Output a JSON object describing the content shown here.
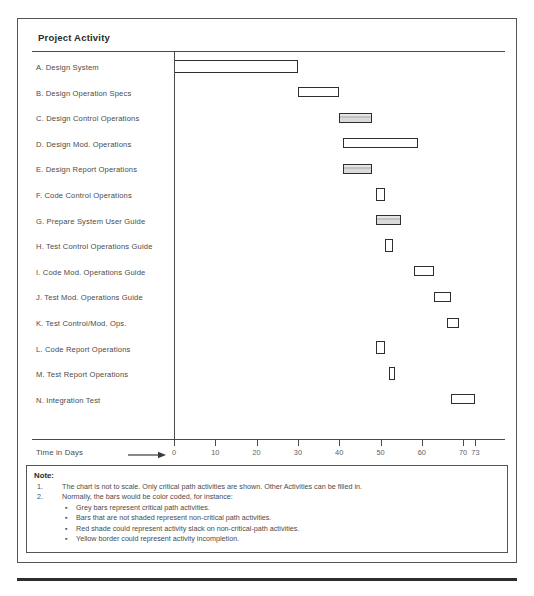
{
  "chart_title": "Project Activity",
  "axis": {
    "caption": "Time in Days",
    "arrow_icon": "right-arrow-icon",
    "ticks": [
      0,
      10,
      20,
      30,
      40,
      50,
      60,
      70,
      73
    ],
    "tick_labels": [
      "0",
      "10",
      "20",
      "30",
      "40",
      "50",
      "60",
      "70",
      "73"
    ],
    "min": 0,
    "max": 73
  },
  "colors": {
    "bar_border": "#2e2e2e",
    "bar_shaded_fill": "#c2c2c2",
    "bar_unshaded_fill": "#ffffff",
    "frame": "#555555",
    "text": "#4b4b4b"
  },
  "chart_data": {
    "type": "bar",
    "title": "Project Activity",
    "xlabel": "Time in Days",
    "ylabel": "",
    "xlim": [
      0,
      73
    ],
    "grid": false,
    "orientation": "horizontal",
    "subtype": "gantt",
    "categories": [
      "A.  Design System",
      "B.  Design Operation Specs",
      "C.  Design Control Operations",
      "D.  Design Mod. Operations",
      "E.  Design Report Operations",
      "F.  Code Control Operations",
      "G.  Prepare System User Guide",
      "H.  Test Control Operations Guide",
      "I.  Code Mod. Operations Guide",
      "J.  Test Mod. Operations Guide",
      "K.  Test Control/Mod. Ops.",
      "L.  Code Report Operations",
      "M.  Test Report Operations",
      "N.  Integration Test"
    ],
    "tasks": [
      {
        "id": "A",
        "label": "A.  Design System",
        "start": 0,
        "end": 30,
        "shaded": false,
        "tall": true
      },
      {
        "id": "B",
        "label": "B.  Design Operation Specs",
        "start": 30,
        "end": 40,
        "shaded": false,
        "tall": false
      },
      {
        "id": "C",
        "label": "C.  Design Control Operations",
        "start": 40,
        "end": 48,
        "shaded": true,
        "tall": false
      },
      {
        "id": "D",
        "label": "D.  Design Mod. Operations",
        "start": 41,
        "end": 59,
        "shaded": false,
        "tall": false
      },
      {
        "id": "E",
        "label": "E.  Design Report Operations",
        "start": 41,
        "end": 48,
        "shaded": true,
        "tall": false
      },
      {
        "id": "F",
        "label": "F.  Code Control Operations",
        "start": 49,
        "end": 51,
        "shaded": false,
        "tall": true
      },
      {
        "id": "G",
        "label": "G.  Prepare System User Guide",
        "start": 49,
        "end": 55,
        "shaded": true,
        "tall": false
      },
      {
        "id": "H",
        "label": "H.  Test Control Operations Guide",
        "start": 51,
        "end": 53,
        "shaded": false,
        "tall": true
      },
      {
        "id": "I",
        "label": "I.  Code Mod. Operations Guide",
        "start": 58,
        "end": 63,
        "shaded": false,
        "tall": false
      },
      {
        "id": "J",
        "label": "J.  Test Mod. Operations Guide",
        "start": 63,
        "end": 67,
        "shaded": false,
        "tall": false
      },
      {
        "id": "K",
        "label": "K.  Test Control/Mod. Ops.",
        "start": 66,
        "end": 69,
        "shaded": false,
        "tall": false
      },
      {
        "id": "L",
        "label": "L.  Code Report Operations",
        "start": 49,
        "end": 51,
        "shaded": false,
        "tall": true
      },
      {
        "id": "M",
        "label": "M.  Test Report Operations",
        "start": 52,
        "end": 53,
        "shaded": false,
        "tall": true
      },
      {
        "id": "N",
        "label": "N.  Integration Test",
        "start": 67,
        "end": 73,
        "shaded": false,
        "tall": false
      }
    ]
  },
  "note": {
    "heading": "Note:",
    "numbered": [
      {
        "num": "1.",
        "text": "The chart is not to scale. Only critical path activities are shown.  Other Activities can be filled in."
      },
      {
        "num": "2.",
        "text": "Normally, the bars would be color coded, for instance:"
      }
    ],
    "bullets": [
      "Grey bars represent critical path activities.",
      "Bars that are not shaded represent non-critical path activities.",
      "Red shade could represent activity slack on non-critical-path activities.",
      "Yellow border could represent activity incompletion."
    ]
  }
}
